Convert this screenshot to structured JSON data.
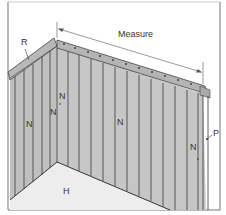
{
  "diagram": {
    "labels": {
      "measure": "Measure",
      "R": "R",
      "N1": "N",
      "N2": "N",
      "N3": "N",
      "N4": "N",
      "N5": "N",
      "P": "P",
      "H": "H"
    },
    "colors": {
      "frame": "#555555",
      "wall_slats": "#c4c4c4",
      "slat_lines": "#3a3a3a",
      "rail": "#b0b0b0",
      "floor": "#ececec",
      "background": "#ffffff"
    }
  }
}
